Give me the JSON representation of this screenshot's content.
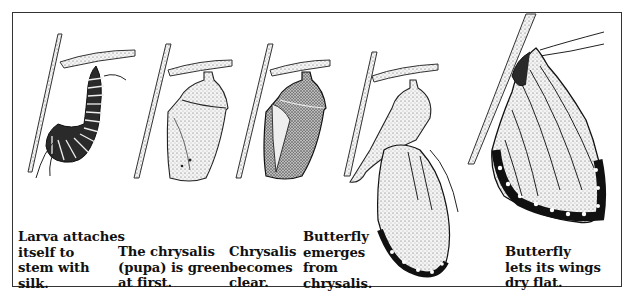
{
  "diagram": {
    "stages": [
      {
        "id": "larva",
        "caption": "Larva attaches\nitself to\nstem with\nsilk."
      },
      {
        "id": "chrysalis-green",
        "caption": "The chrysalis\n(pupa) is green\nat first."
      },
      {
        "id": "chrysalis-clear",
        "caption": "Chrysalis\nbecomes\nclear."
      },
      {
        "id": "emerging",
        "caption": "Butterfly\nemerges\nfrom\nchrysalis."
      },
      {
        "id": "drying",
        "caption": "Butterfly\nlets its wings\ndry flat."
      }
    ]
  }
}
